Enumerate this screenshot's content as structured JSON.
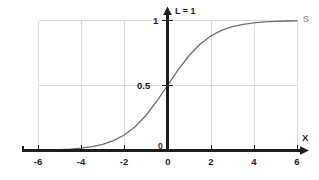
{
  "chart_data": {
    "type": "line",
    "title": "",
    "subtitle": "",
    "xlabel": "X",
    "ylabel": "",
    "xlim": [
      -6.6,
      6.6
    ],
    "ylim": [
      -0.06,
      1.08
    ],
    "grid": true,
    "grid_color": "#d9d9d9",
    "legend_position": "none",
    "axis_color": "#1c1c1c",
    "curve_color": "#6e6e6e",
    "background": "#ffffff",
    "x_ticks": [
      {
        "value": -6,
        "label": "-6"
      },
      {
        "value": -4,
        "label": "-4"
      },
      {
        "value": -2,
        "label": "-2"
      },
      {
        "value": 0,
        "label": "0"
      },
      {
        "value": 2,
        "label": "2"
      },
      {
        "value": 4,
        "label": "4"
      },
      {
        "value": 6,
        "label": "6"
      }
    ],
    "y_ticks": [
      {
        "value": 0,
        "label": "0"
      },
      {
        "value": 0.5,
        "label": "0.5"
      },
      {
        "value": 1,
        "label": "1"
      }
    ],
    "gridlines_x": [
      -6,
      -4,
      -2,
      2,
      4,
      6
    ],
    "gridlines_y": [
      0.5,
      1
    ],
    "annotations": [
      {
        "name": "asymptote-label",
        "text": "L = 1",
        "x": 0.25,
        "y": 1.07
      },
      {
        "name": "curve-label",
        "text": "S",
        "x": 6.35,
        "y": 1.0
      },
      {
        "name": "x-axis-label",
        "text": "X",
        "x": 6.45,
        "y": 0.12
      },
      {
        "name": "origin-label",
        "text": "0",
        "x": -0.28,
        "y": 0.025
      }
    ],
    "series": [
      {
        "name": "S",
        "function": "logistic",
        "equation": "y = 1 / (1 + e^(-x))",
        "x": [
          -6.0,
          -5.5,
          -5.0,
          -4.5,
          -4.0,
          -3.5,
          -3.0,
          -2.5,
          -2.0,
          -1.5,
          -1.0,
          -0.5,
          0.0,
          0.5,
          1.0,
          1.5,
          2.0,
          2.5,
          3.0,
          3.5,
          4.0,
          4.5,
          5.0,
          5.5,
          6.0
        ],
        "values": [
          0.0025,
          0.0041,
          0.0067,
          0.011,
          0.018,
          0.0293,
          0.0474,
          0.0759,
          0.1192,
          0.1824,
          0.2689,
          0.3775,
          0.5,
          0.6225,
          0.7311,
          0.8176,
          0.8808,
          0.9241,
          0.9526,
          0.9707,
          0.982,
          0.989,
          0.9933,
          0.9959,
          0.9975
        ]
      }
    ]
  }
}
